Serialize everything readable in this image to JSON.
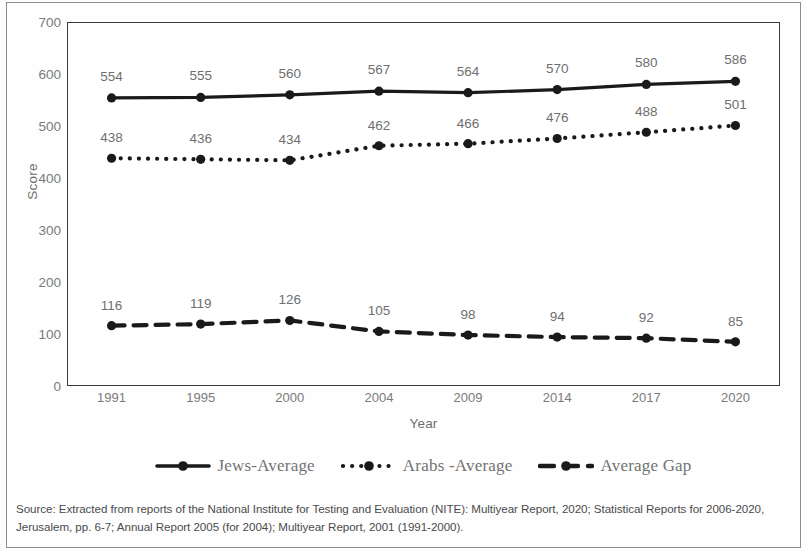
{
  "chart_data": {
    "type": "line",
    "title": "",
    "xlabel": "Year",
    "ylabel": "Score",
    "ylim": [
      0,
      700
    ],
    "yticks": [
      0,
      100,
      200,
      300,
      400,
      500,
      600,
      700
    ],
    "grid": false,
    "legend_position": "bottom",
    "categories": [
      "1991",
      "1995",
      "2000",
      "2004",
      "2009",
      "2014",
      "2017",
      "2020"
    ],
    "series": [
      {
        "name": "Jews-Average",
        "style": "solid-line-round-marker",
        "color": "#1a1a1a",
        "values": [
          554,
          555,
          560,
          567,
          564,
          570,
          580,
          586
        ],
        "label_offset": -14
      },
      {
        "name": "Arabs -Average",
        "style": "dotted-line-round-marker",
        "color": "#1a1a1a",
        "values": [
          438,
          436,
          434,
          462,
          466,
          476,
          488,
          501
        ],
        "label_offset": -13
      },
      {
        "name": "Average Gap",
        "style": "dashed-line-round-marker",
        "color": "#1a1a1a",
        "values": [
          116,
          119,
          126,
          105,
          98,
          94,
          92,
          85
        ],
        "label_offset": -13
      }
    ]
  },
  "axes": {
    "y_title": "Score",
    "x_title": "Year"
  },
  "legend": {
    "items": [
      {
        "label": "Jews-Average",
        "marker": "solid-line-marker"
      },
      {
        "label": "Arabs -Average",
        "marker": "dotted-line-marker"
      },
      {
        "label": "Average Gap",
        "marker": "dashed-line-marker"
      }
    ]
  },
  "source": {
    "text": "Source: Extracted from reports of the National Institute for Testing and Evaluation (NITE): Multiyear Report, 2020; Statistical Reports for 2006-2020, Jerusalem, pp. 6-7; Annual Report 2005 (for 2004); Multiyear Report, 2001 (1991-2000)."
  }
}
